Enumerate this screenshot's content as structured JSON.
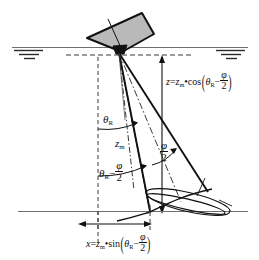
{
  "figure": {
    "type": "technical-diagram",
    "background_color": "#ffffff",
    "line_color": "#111111",
    "transducer_fill": "#b9b9b9",
    "surface_line_color": "#6e6e6e",
    "seafloor_line_color": "#6e6e6e",
    "dashed_color": "#4a4a4a"
  },
  "labels": {
    "theta_r": {
      "symbol": "θ",
      "subscript": "R",
      "meaning": "beam-pointing angle from nadir"
    },
    "zm": {
      "symbol": "z",
      "subscript": "m",
      "meaning": "measured slant range"
    },
    "theta_minus_half_phi": {
      "symbol": "θ",
      "subscript": "R",
      "operator": "−",
      "fraction_num": "φ",
      "fraction_den": "2"
    },
    "half_phi": {
      "fraction_num": "φ",
      "fraction_den": "2",
      "meaning": "half beam width"
    }
  },
  "formulas": {
    "depth": {
      "lhs": "z",
      "equals": "=",
      "var": "z",
      "var_sub": "m",
      "dot": "•",
      "func": "cos",
      "open_paren": "(",
      "angle": "θ",
      "angle_sub": "R",
      "minus": "−",
      "frac_num": "φ",
      "frac_den": "2",
      "close_paren": ")",
      "plain": "z = z_m • cos(θ_R − φ/2)"
    },
    "across_track": {
      "lhs": "x",
      "equals": "=",
      "var": "z",
      "var_sub": "m",
      "dot": "•",
      "func": "sin",
      "open_paren": "(",
      "angle": "θ",
      "angle_sub": "R",
      "minus": "−",
      "frac_num": "φ",
      "frac_den": "2",
      "close_paren": ")",
      "plain": "x = z_m • sin(θ_R − φ/2)"
    }
  },
  "icons": {
    "water_surface_left": "water-surface-symbol",
    "water_surface_right": "water-surface-symbol",
    "transducer": "transducer-shape",
    "footprint": "beam-footprint-ellipse"
  }
}
